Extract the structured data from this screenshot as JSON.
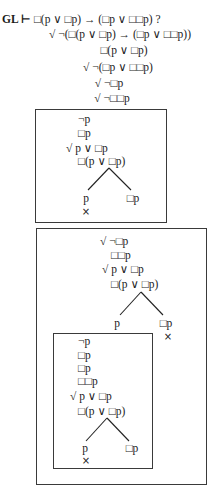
{
  "header": {
    "prefix": "GL ⊢ ",
    "goal": "□(p ∨ □p) → (□p ∨ □□p) ?"
  },
  "root": {
    "lines": [
      "√ ¬(□(p ∨ □p) → (□p ∨ □□p))",
      "□(p  ∨  □p)",
      "√ ¬(□p  ∨  □□p)",
      "√ ¬□p",
      "√ ¬□□p"
    ]
  },
  "world1": {
    "lines": [
      "¬p",
      "□p",
      "√ p ∨ □p",
      "□(p ∨ □p)"
    ],
    "branches": {
      "left": {
        "label": "p",
        "closed": "×"
      },
      "right": {
        "label": "□p",
        "closed": ""
      }
    }
  },
  "world2": {
    "lines": [
      "√ ¬□p",
      "□□p",
      "√ p ∨ □p",
      "□(p ∨ □p)"
    ],
    "branches": {
      "left": {
        "label": "p",
        "closed": ""
      },
      "right": {
        "label": "□p",
        "closed": "×"
      }
    },
    "world3": {
      "lines": [
        "¬p",
        "□p",
        "□p",
        "□□p",
        "√ p ∨ □p",
        "□(p ∨ □p)"
      ],
      "branches": {
        "left": {
          "label": "p",
          "closed": "×"
        },
        "right": {
          "label": "□p",
          "closed": ""
        }
      }
    }
  }
}
